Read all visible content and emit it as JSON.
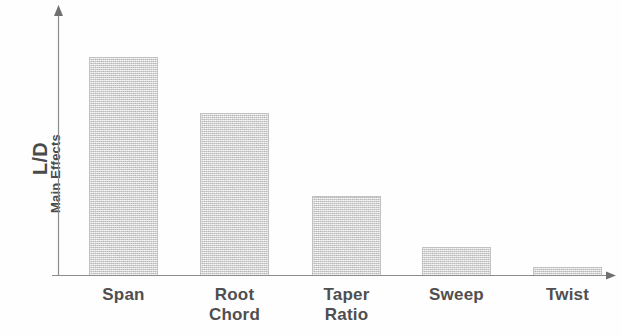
{
  "chart_data": {
    "type": "bar",
    "title": "",
    "subtitle": "",
    "xlabel": "",
    "ylabel": "L/D Main Effects",
    "ylabel_lines": [
      "L/D",
      "Main Effects"
    ],
    "categories": [
      "Span",
      "Root Chord",
      "Taper Ratio",
      "Sweep",
      "Twist"
    ],
    "category_lines": [
      [
        "Span"
      ],
      [
        "Root",
        "Chord"
      ],
      [
        "Taper",
        "Ratio"
      ],
      [
        "Sweep"
      ],
      [
        "Twist"
      ]
    ],
    "values": [
      1.0,
      0.74,
      0.36,
      0.13,
      0.04
    ],
    "ylim": [
      0,
      1.23
    ],
    "grid": false,
    "legend": null,
    "axis_ticks": [],
    "bar_color": "#d8d8d8",
    "bar_edge_color": "#c2c2c2",
    "axis_color": "#8c8c8c",
    "text_color": "#4f4f4f",
    "background_color": "#fefefe",
    "annotations": []
  },
  "axis": {
    "y_label_primary": "L/D",
    "y_label_secondary": "Main Effects"
  },
  "bars": [
    {
      "label": "Span",
      "line1": "Span",
      "line2": "",
      "value": 1.0,
      "left": 89,
      "width": 69,
      "height": 218
    },
    {
      "label": "Root Chord",
      "line1": "Root",
      "line2": "Chord",
      "value": 0.74,
      "left": 200,
      "width": 69,
      "height": 162
    },
    {
      "label": "Taper Ratio",
      "line1": "Taper",
      "line2": "Ratio",
      "value": 0.36,
      "left": 312,
      "width": 69,
      "height": 79
    },
    {
      "label": "Sweep",
      "line1": "Sweep",
      "line2": "",
      "value": 0.13,
      "left": 422,
      "width": 69,
      "height": 28
    },
    {
      "label": "Twist",
      "line1": "Twist",
      "line2": "",
      "value": 0.04,
      "left": 533,
      "width": 69,
      "height": 8
    }
  ]
}
